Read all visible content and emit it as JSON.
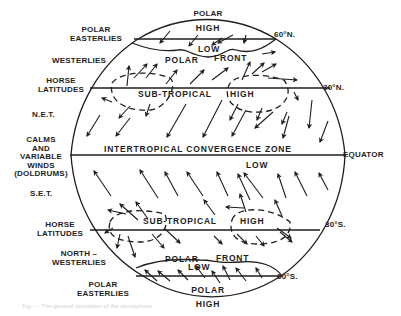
{
  "diagram": {
    "type": "global-wind-circulation",
    "line_color": "#1e1e1e",
    "background": "#ffffff"
  },
  "latitudes": {
    "n60": "60°N.",
    "n30": "30°N.",
    "equator": "EQUATOR",
    "s30": "30°S.",
    "s60": "60°S."
  },
  "left_labels": {
    "polar_easterlies_n": [
      "POLAR",
      "EASTERLIES"
    ],
    "westerlies": "WESTERLIES",
    "horse_latitudes_n": [
      "HORSE",
      "LATITUDES"
    ],
    "net": "N.E.T.",
    "doldrums": [
      "CALMS",
      "AND",
      "VARIABLE",
      "WINDS",
      "(DOLDRUMS)"
    ],
    "set": "S.E.T.",
    "horse_latitudes_s": [
      "HORSE",
      "LATITUDES"
    ],
    "north_westerlies": [
      "NORTH –",
      "WESTERLIES"
    ],
    "polar_easterlies_s": [
      "POLAR",
      "EASTERLIES"
    ]
  },
  "inner_labels": {
    "polar_high_n": [
      "POLAR",
      "HIGH"
    ],
    "low_n": "LOW",
    "polar_front_n": [
      "POLAR",
      "FRONT"
    ],
    "subtropical_n": "SUB-TROPICAL",
    "high_n": "HIGH",
    "itcz": "INTERTROPICAL CONVERGENCE ZONE",
    "low_eq": "LOW",
    "subtropical_s": "SUB-TROPICAL",
    "high_s": "HIGH",
    "polar_front_s": [
      "POLAR",
      "FRONT"
    ],
    "low_s": "LOW",
    "polar_high_s": [
      "POLAR",
      "HIGH"
    ]
  },
  "caption": "Fig. — The general circulation of the atmosphere"
}
